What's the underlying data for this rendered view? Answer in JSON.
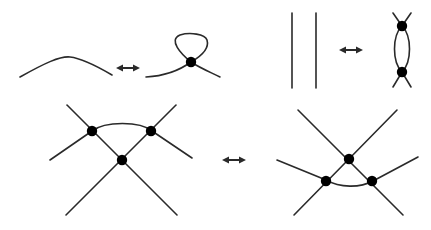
{
  "diagram": {
    "title": "",
    "colors": {
      "stroke": "#2a2a2a",
      "background": "#ffffff"
    },
    "moves": [
      {
        "id": "vR1",
        "left": "single arc",
        "right": "arc with virtual kink loop",
        "connector": "double-headed-arrow"
      },
      {
        "id": "vR2",
        "left": "two parallel vertical strands",
        "right": "two strands with two virtual crossings",
        "connector": "double-headed-arrow"
      },
      {
        "id": "vR3",
        "left": "three strands with three virtual crossings (arc above)",
        "right": "three strands with three virtual crossings (arc below)",
        "connector": "double-headed-arrow"
      }
    ]
  }
}
